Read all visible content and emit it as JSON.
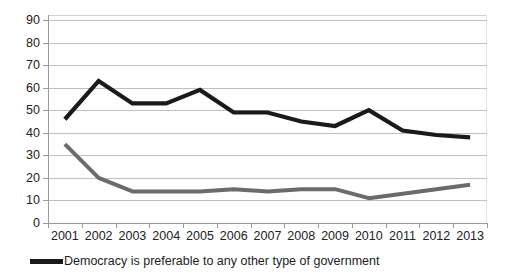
{
  "chart_data": {
    "type": "line",
    "title": "",
    "xlabel": "",
    "ylabel": "",
    "grid": true,
    "legend_position": "bottom-left",
    "ylim": [
      0,
      90
    ],
    "ytick_step": 10,
    "yticks": [
      "0",
      "10",
      "20",
      "30",
      "40",
      "50",
      "60",
      "70",
      "80",
      "90"
    ],
    "categories": [
      "2001",
      "2002",
      "2003",
      "2004",
      "2005",
      "2006",
      "2007",
      "2008",
      "2009",
      "2010",
      "2011",
      "2012",
      "2013"
    ],
    "series": [
      {
        "name": "Democracy is preferable to any other type of government",
        "color": "#1a1a1a",
        "values": [
          46,
          63,
          53,
          53,
          59,
          49,
          49,
          45,
          43,
          50,
          41,
          39,
          38
        ]
      },
      {
        "name": "",
        "color": "#6b6b6b",
        "values": [
          35,
          20,
          14,
          14,
          14,
          15,
          14,
          15,
          15,
          11,
          13,
          15,
          17
        ]
      }
    ]
  },
  "legend": {
    "entries": [
      {
        "label": "Democracy is preferable to any other type of government",
        "color": "#1a1a1a"
      }
    ]
  }
}
